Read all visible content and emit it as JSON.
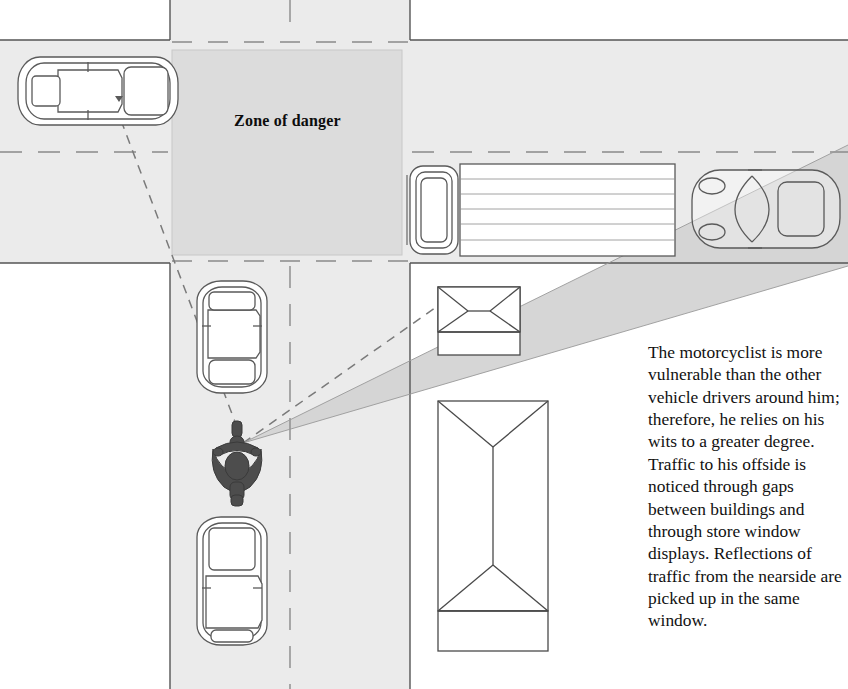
{
  "figure": {
    "type": "road-safety-diagram",
    "zone_label": "Zone of danger",
    "caption": "The motorcyclist is more vulnerable than the other vehicle drivers around him; therefore, he relies on his wits to a greater degree. Traffic to his offside is noticed through gaps between buildings and through store window displays. Reflections of traffic from the nearside are picked up in the same window.",
    "colors": {
      "page_background": "#ffffff",
      "road_fill": "#ebebeb",
      "zone_fill": "#dcdcdc",
      "sight_cone_fill": "#d5d5d5",
      "vehicle_outline": "#555555",
      "building_outline": "#4a4a4a",
      "motorcyclist_fill": "#4a4a4a",
      "road_edge_line": "#555555",
      "lane_dash": "#777777",
      "sight_line": "#666666",
      "text_color": "#111111"
    },
    "elements": {
      "roads": [
        {
          "name": "horizontal-road",
          "x": 0,
          "y": 40,
          "width": 848,
          "height": 223
        },
        {
          "name": "vertical-road",
          "x": 170,
          "y": 0,
          "width": 240,
          "height": 689
        }
      ],
      "zone_of_danger": {
        "x": 172,
        "y": 50,
        "width": 230,
        "height": 205
      },
      "vehicles": [
        {
          "name": "car-left-horizontal",
          "orientation": "horizontal",
          "x": 18,
          "y": 56,
          "width": 160,
          "height": 70
        },
        {
          "name": "truck-cab-and-trailer",
          "orientation": "horizontal",
          "x": 410,
          "y": 164,
          "width": 265,
          "height": 92
        },
        {
          "name": "sports-car-right",
          "orientation": "horizontal",
          "x": 690,
          "y": 168,
          "width": 150,
          "height": 82
        },
        {
          "name": "car-upper-vertical",
          "orientation": "vertical",
          "x": 196,
          "y": 281,
          "width": 70,
          "height": 110
        },
        {
          "name": "motorcyclist",
          "orientation": "vertical",
          "x": 210,
          "y": 424,
          "width": 56,
          "height": 72
        },
        {
          "name": "car-lower-vertical",
          "orientation": "vertical",
          "x": 196,
          "y": 515,
          "width": 70,
          "height": 128
        }
      ],
      "buildings": [
        {
          "name": "small-building-roof",
          "x": 438,
          "y": 287,
          "width": 82,
          "height": 68
        },
        {
          "name": "large-building-roof",
          "x": 438,
          "y": 401,
          "width": 110,
          "height": 210
        }
      ],
      "sight_cone": {
        "apex_x": 243,
        "apex_y": 443,
        "spread_top_y": 145,
        "spread_bottom_y": 266
      },
      "sight_lines_dashed": [
        {
          "from_x": 243,
          "from_y": 443,
          "to_x": 118,
          "to_y": 108
        },
        {
          "from_x": 243,
          "from_y": 443,
          "to_x": 448,
          "to_y": 296
        }
      ]
    }
  }
}
